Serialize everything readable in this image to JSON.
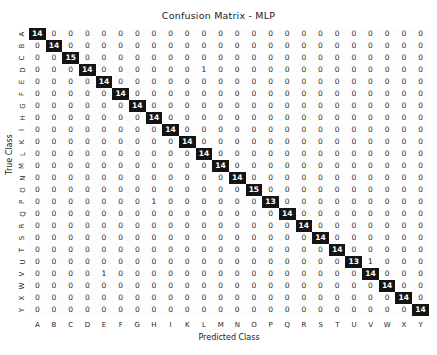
{
  "chart_data": {
    "type": "heatmap",
    "title": "Confusion Matrix - MLP",
    "xlabel": "Predicted Class",
    "ylabel": "True Class",
    "grid": false,
    "legend": "none",
    "colormap": "dark-on-light",
    "colors": {
      "high": "#141414",
      "low": "#fdfdfd",
      "text_on_high": "#ffffff",
      "text_on_low": "#2b2b2b",
      "background": "#ffffff"
    },
    "categories": [
      "A",
      "B",
      "C",
      "D",
      "E",
      "F",
      "G",
      "H",
      "I",
      "K",
      "L",
      "M",
      "N",
      "O",
      "P",
      "Q",
      "R",
      "S",
      "T",
      "U",
      "V",
      "W",
      "X",
      "Y"
    ],
    "x_tick_labels": [
      "A",
      "B",
      "C",
      "D",
      "E",
      "F",
      "G",
      "H",
      "I",
      "K",
      "L",
      "M",
      "N",
      "O",
      "P",
      "Q",
      "R",
      "S",
      "T",
      "U",
      "V",
      "W",
      "X",
      "Y"
    ],
    "y_tick_labels": [
      "A",
      "B",
      "C",
      "D",
      "E",
      "F",
      "G",
      "H",
      "I",
      "K",
      "L",
      "M",
      "N",
      "O",
      "P",
      "Q",
      "R",
      "S",
      "T",
      "U",
      "V",
      "W",
      "X",
      "Y"
    ],
    "vmin": 0,
    "vmax": 15,
    "values": [
      [
        14,
        0,
        0,
        0,
        0,
        0,
        0,
        0,
        0,
        0,
        0,
        0,
        0,
        0,
        0,
        0,
        0,
        0,
        0,
        0,
        0,
        0,
        0,
        0
      ],
      [
        0,
        14,
        0,
        0,
        0,
        0,
        0,
        0,
        0,
        0,
        0,
        0,
        0,
        0,
        0,
        0,
        0,
        0,
        0,
        0,
        0,
        0,
        0,
        0
      ],
      [
        0,
        0,
        15,
        0,
        0,
        0,
        0,
        0,
        0,
        0,
        0,
        0,
        0,
        0,
        0,
        0,
        0,
        0,
        0,
        0,
        0,
        0,
        0,
        0
      ],
      [
        0,
        0,
        0,
        14,
        0,
        0,
        0,
        0,
        0,
        0,
        1,
        0,
        0,
        0,
        0,
        0,
        0,
        0,
        0,
        0,
        0,
        0,
        0,
        0
      ],
      [
        0,
        0,
        0,
        0,
        14,
        0,
        0,
        0,
        0,
        0,
        0,
        0,
        0,
        0,
        0,
        0,
        0,
        0,
        0,
        0,
        0,
        0,
        0,
        0
      ],
      [
        0,
        0,
        0,
        0,
        0,
        14,
        0,
        0,
        0,
        0,
        0,
        0,
        0,
        0,
        0,
        0,
        0,
        0,
        0,
        0,
        0,
        0,
        0,
        0
      ],
      [
        0,
        0,
        0,
        0,
        0,
        0,
        14,
        0,
        0,
        0,
        0,
        0,
        0,
        0,
        0,
        0,
        0,
        0,
        0,
        0,
        0,
        0,
        0,
        0
      ],
      [
        0,
        0,
        0,
        0,
        0,
        0,
        0,
        14,
        0,
        0,
        0,
        0,
        0,
        0,
        0,
        0,
        0,
        0,
        0,
        0,
        0,
        0,
        0,
        0
      ],
      [
        0,
        0,
        0,
        0,
        0,
        0,
        0,
        0,
        14,
        0,
        0,
        0,
        0,
        0,
        0,
        0,
        0,
        0,
        0,
        0,
        0,
        0,
        0,
        0
      ],
      [
        0,
        0,
        0,
        0,
        0,
        0,
        0,
        0,
        0,
        14,
        0,
        0,
        0,
        0,
        0,
        0,
        0,
        0,
        0,
        0,
        0,
        0,
        0,
        0
      ],
      [
        0,
        0,
        0,
        0,
        0,
        0,
        0,
        0,
        0,
        0,
        14,
        0,
        0,
        0,
        0,
        0,
        0,
        0,
        0,
        0,
        0,
        0,
        0,
        0
      ],
      [
        0,
        0,
        0,
        0,
        0,
        0,
        0,
        0,
        0,
        0,
        0,
        14,
        0,
        0,
        0,
        0,
        0,
        0,
        0,
        0,
        0,
        0,
        0,
        0
      ],
      [
        0,
        0,
        0,
        0,
        0,
        0,
        0,
        0,
        0,
        0,
        0,
        0,
        14,
        0,
        0,
        0,
        0,
        0,
        0,
        0,
        0,
        0,
        0,
        0
      ],
      [
        0,
        0,
        0,
        0,
        0,
        0,
        0,
        0,
        0,
        0,
        0,
        0,
        0,
        15,
        0,
        0,
        0,
        0,
        0,
        0,
        0,
        0,
        0,
        0
      ],
      [
        0,
        0,
        0,
        0,
        0,
        0,
        0,
        1,
        0,
        0,
        0,
        0,
        0,
        0,
        13,
        0,
        0,
        0,
        0,
        0,
        0,
        0,
        0,
        0
      ],
      [
        0,
        0,
        0,
        0,
        0,
        0,
        0,
        0,
        0,
        0,
        0,
        0,
        0,
        0,
        0,
        14,
        0,
        0,
        0,
        0,
        0,
        0,
        0,
        0
      ],
      [
        0,
        0,
        0,
        0,
        0,
        0,
        0,
        0,
        0,
        0,
        0,
        0,
        0,
        0,
        0,
        0,
        14,
        0,
        0,
        0,
        0,
        0,
        0,
        0
      ],
      [
        0,
        0,
        0,
        0,
        0,
        0,
        0,
        0,
        0,
        0,
        0,
        0,
        0,
        0,
        0,
        0,
        0,
        14,
        0,
        0,
        0,
        0,
        0,
        0
      ],
      [
        0,
        0,
        0,
        0,
        0,
        0,
        0,
        0,
        0,
        0,
        0,
        0,
        0,
        0,
        0,
        0,
        0,
        0,
        14,
        0,
        0,
        0,
        0,
        0
      ],
      [
        0,
        0,
        0,
        0,
        0,
        0,
        0,
        0,
        0,
        0,
        0,
        0,
        0,
        0,
        0,
        0,
        0,
        0,
        0,
        13,
        1,
        0,
        0,
        0
      ],
      [
        0,
        0,
        0,
        0,
        1,
        0,
        0,
        0,
        0,
        0,
        0,
        0,
        0,
        0,
        0,
        0,
        0,
        0,
        0,
        0,
        14,
        0,
        0,
        0
      ],
      [
        0,
        0,
        0,
        0,
        0,
        0,
        0,
        0,
        0,
        0,
        0,
        0,
        0,
        0,
        0,
        0,
        0,
        0,
        0,
        0,
        0,
        14,
        0,
        0
      ],
      [
        0,
        0,
        0,
        0,
        0,
        0,
        0,
        0,
        0,
        0,
        0,
        0,
        0,
        0,
        0,
        0,
        0,
        0,
        0,
        0,
        0,
        0,
        14,
        0
      ],
      [
        0,
        0,
        0,
        0,
        0,
        0,
        0,
        0,
        0,
        0,
        0,
        0,
        0,
        0,
        0,
        0,
        0,
        0,
        0,
        0,
        0,
        0,
        0,
        14
      ]
    ]
  }
}
